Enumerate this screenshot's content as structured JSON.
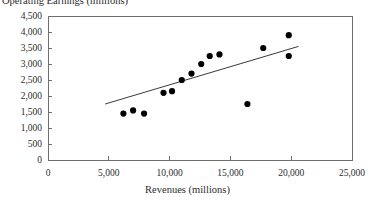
{
  "chart_data": {
    "type": "scatter",
    "title": "Operating Earnings (millions)",
    "xlabel": "Revenues (millions)",
    "ylabel": "Operating Earnings (millions)",
    "xlim": [
      0,
      25000
    ],
    "ylim": [
      0,
      4500
    ],
    "grid": false,
    "legend": "none",
    "x_ticks": [
      0,
      5000,
      10000,
      15000,
      20000,
      25000
    ],
    "x_tick_labels": [
      "0",
      "5,000",
      "10,000",
      "15,000",
      "20,000",
      "25,000"
    ],
    "y_ticks": [
      0,
      500,
      1000,
      1500,
      2000,
      2500,
      3000,
      3500,
      4000,
      4500
    ],
    "y_tick_labels": [
      "0",
      "500",
      "1,000",
      "1,500",
      "2,000",
      "2,500",
      "3,000",
      "3,500",
      "4,000",
      "4,500"
    ],
    "point_color": "#000000",
    "trendline_color": "#3a3a3a",
    "axis_color": "#6e6e6e",
    "series": [
      {
        "name": "Companies",
        "points": [
          {
            "x": 6200,
            "y": 1450
          },
          {
            "x": 7000,
            "y": 1550
          },
          {
            "x": 7900,
            "y": 1450
          },
          {
            "x": 9500,
            "y": 2100
          },
          {
            "x": 10200,
            "y": 2150
          },
          {
            "x": 11000,
            "y": 2500
          },
          {
            "x": 11800,
            "y": 2700
          },
          {
            "x": 12600,
            "y": 3000
          },
          {
            "x": 13300,
            "y": 3250
          },
          {
            "x": 14100,
            "y": 3300
          },
          {
            "x": 16400,
            "y": 1750
          },
          {
            "x": 17700,
            "y": 3500
          },
          {
            "x": 19800,
            "y": 3900
          },
          {
            "x": 19800,
            "y": 3250
          }
        ]
      }
    ],
    "trendline": {
      "name": "Linear fit",
      "x_start": 4700,
      "y_start": 1750,
      "x_end": 20600,
      "y_end": 3550
    }
  }
}
